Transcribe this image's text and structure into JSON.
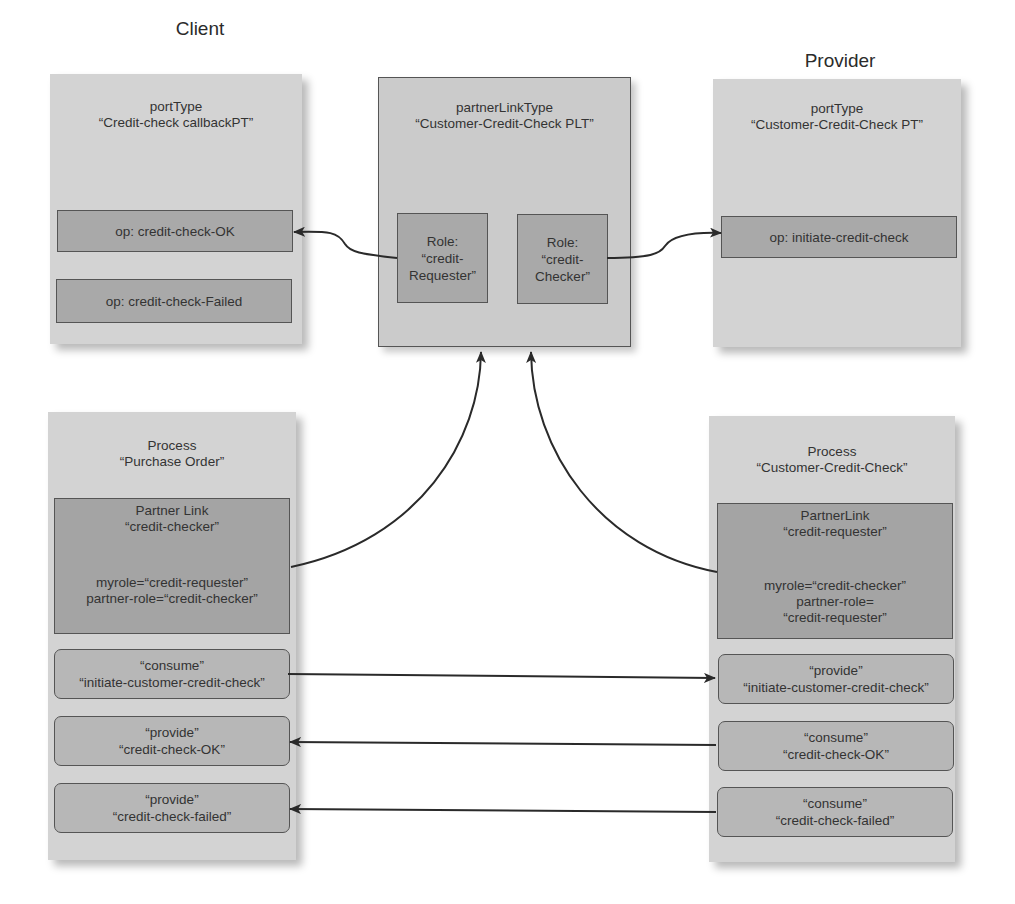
{
  "columns": {
    "client_label": "Client",
    "provider_label": "Provider"
  },
  "client_porttype": {
    "kind": "portType",
    "name": "“Credit-check callbackPT”",
    "operations": [
      {
        "label": "op: credit-check-OK"
      },
      {
        "label": "op: credit-check-Failed"
      }
    ]
  },
  "partner_link_type": {
    "kind": "partnerLinkType",
    "name": "“Customer-Credit-Check PLT”",
    "roles": [
      {
        "line1": "Role:",
        "line2": "“credit-",
        "line3": "Requester”"
      },
      {
        "line1": "Role:",
        "line2": "“credit-",
        "line3": "Checker”"
      }
    ]
  },
  "provider_porttype": {
    "kind": "portType",
    "name": "“Customer-Credit-Check PT”",
    "operations": [
      {
        "label": "op: initiate-credit-check"
      }
    ]
  },
  "client_process": {
    "kind": "Process",
    "name": "“Purchase Order”",
    "partner_link": {
      "kind": "Partner Link",
      "name": "“credit-checker”",
      "myrole": "myrole=“credit-requester”",
      "partner_role": "partner-role=“credit-checker”"
    },
    "activities": [
      {
        "verb": "“consume”",
        "op": "“initiate-customer-credit-check”"
      },
      {
        "verb": "“provide”",
        "op": "“credit-check-OK”"
      },
      {
        "verb": "“provide”",
        "op": "“credit-check-failed”"
      }
    ]
  },
  "provider_process": {
    "kind": "Process",
    "name": "“Customer-Credit-Check”",
    "partner_link": {
      "kind": "PartnerLink",
      "name": "“credit-requester”",
      "myrole": "myrole=“credit-checker”",
      "partner_role_line1": "partner-role=",
      "partner_role_line2": "“credit-requester”"
    },
    "activities": [
      {
        "verb": "“provide”",
        "op": "“initiate-customer-credit-check”"
      },
      {
        "verb": "“consume”",
        "op": "“credit-check-OK”"
      },
      {
        "verb": "“consume”",
        "op": "“credit-check-failed”"
      }
    ]
  },
  "colors": {
    "panel_bg": "#d3d3d3",
    "inner_box_bg": "#a9a9a9",
    "activity_bg": "#b7b7b7",
    "border": "#555555",
    "arrow": "#2a2a2a"
  }
}
